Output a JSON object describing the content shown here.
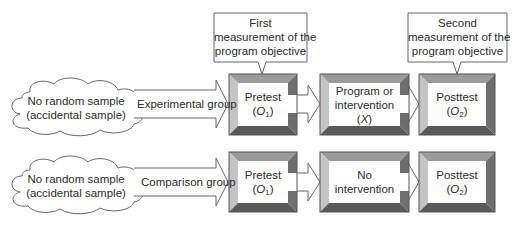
{
  "callouts": [
    {
      "lines": [
        "First",
        "measurement of the",
        "program objective"
      ]
    },
    {
      "lines": [
        "Second",
        "measurement of the",
        "program objective"
      ]
    }
  ],
  "rows": [
    {
      "source": {
        "lines": [
          "No random sample",
          "(accidental sample)"
        ]
      },
      "group_label": "Experimental group",
      "boxes": [
        {
          "title": "Pretest",
          "symbol": "O",
          "subscript": "1"
        },
        {
          "title_lines": [
            "Program or",
            "intervention"
          ],
          "symbol": "X"
        },
        {
          "title": "Posttest",
          "symbol": "O",
          "subscript": "2"
        }
      ]
    },
    {
      "source": {
        "lines": [
          "No random sample",
          "(accidental sample)"
        ]
      },
      "group_label": "Comparison group",
      "boxes": [
        {
          "title": "Pretest",
          "symbol": "O",
          "subscript": "1"
        },
        {
          "title_lines": [
            "No",
            "intervention"
          ]
        },
        {
          "title": "Posttest",
          "symbol": "O",
          "subscript": "2"
        }
      ]
    }
  ],
  "colors": {
    "bevel_top": "#9a9a9a",
    "bevel_left": "#c4c4c4",
    "bevel_right": "#6e6e6e",
    "bevel_bottom": "#5a5a5a",
    "stroke": "#555555",
    "face": "#ffffff"
  }
}
